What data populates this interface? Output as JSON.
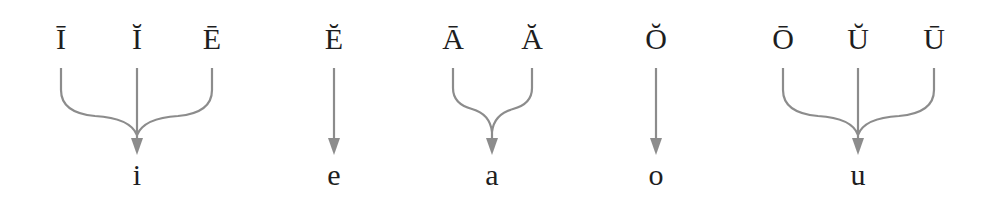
{
  "diagram": {
    "line_color": "#8c8c8c",
    "text_color": "#1e1e1e",
    "groups": [
      {
        "sources": [
          {
            "label": "Ī",
            "x": 61
          },
          {
            "label": "Ĭ",
            "x": 137
          },
          {
            "label": "Ē",
            "x": 212
          }
        ],
        "target": {
          "label": "i",
          "x": 137
        }
      },
      {
        "sources": [
          {
            "label": "Ĕ",
            "x": 334
          }
        ],
        "target": {
          "label": "e",
          "x": 334
        }
      },
      {
        "sources": [
          {
            "label": "Ā",
            "x": 453
          },
          {
            "label": "Ă",
            "x": 532
          }
        ],
        "target": {
          "label": "a",
          "x": 492
        }
      },
      {
        "sources": [
          {
            "label": "Ŏ",
            "x": 656
          }
        ],
        "target": {
          "label": "o",
          "x": 656
        }
      },
      {
        "sources": [
          {
            "label": "Ō",
            "x": 783
          },
          {
            "label": "Ŭ",
            "x": 858
          },
          {
            "label": "Ū",
            "x": 934
          }
        ],
        "target": {
          "label": "u",
          "x": 858
        }
      }
    ]
  }
}
